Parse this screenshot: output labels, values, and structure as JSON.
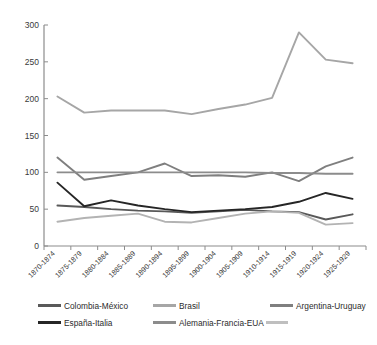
{
  "chart_data": {
    "type": "line",
    "title": "",
    "subtitle": "",
    "xlabel": "",
    "ylabel": "",
    "ylim": [
      0,
      300
    ],
    "yticks": [
      0,
      50,
      100,
      150,
      200,
      250,
      300
    ],
    "grid": false,
    "legend_position": "bottom",
    "categories": [
      "1870-1874",
      "1875-1879",
      "1880-1884",
      "1885-1889",
      "1890-1894",
      "1895-1899",
      "1900-1904",
      "1905-1909",
      "1910-1914",
      "1915-1919",
      "1920-1924",
      "1925-1929"
    ],
    "series": [
      {
        "name": "Colombia-México",
        "color": "#595959",
        "values": [
          55,
          53,
          50,
          48,
          47,
          45,
          47,
          49,
          47,
          46,
          36,
          43
        ]
      },
      {
        "name": "Brasil",
        "color": "#a6a6a6",
        "values": [
          203,
          181,
          184,
          184,
          184,
          179,
          186,
          192,
          201,
          290,
          253,
          248
        ]
      },
      {
        "name": "Argentina-Uruguay",
        "color": "#7f7f7f",
        "values": [
          120,
          90,
          95,
          100,
          112,
          95,
          96,
          94,
          100,
          88,
          108,
          120
        ]
      },
      {
        "name": "España-Italia",
        "color": "#262626",
        "values": [
          86,
          54,
          62,
          55,
          50,
          46,
          48,
          50,
          53,
          60,
          72,
          64
        ]
      },
      {
        "name": "Alemania-Francia-EUA",
        "color": "#8c8c8c",
        "values": [
          100,
          100,
          100,
          100,
          100,
          100,
          100,
          100,
          99,
          99,
          98,
          98
        ]
      },
      {
        "name": "Brasil (low trace)",
        "color": "#b3b3b3",
        "values": [
          33,
          38,
          41,
          44,
          33,
          32,
          38,
          44,
          47,
          45,
          29,
          31
        ]
      }
    ]
  },
  "legend": {
    "items": [
      {
        "label": "Colombia-México",
        "color": "#595959"
      },
      {
        "label": "Brasil",
        "color": "#a6a6a6"
      },
      {
        "label": "Argentina-Uruguay",
        "color": "#7f7f7f"
      },
      {
        "label": "España-Italia",
        "color": "#262626"
      },
      {
        "label": "Alemania-Francia-EUA",
        "color": "#8c8c8c"
      }
    ],
    "trailer_color": "#bfbfbf"
  },
  "axes": {
    "y_tick_labels": [
      "300",
      "250",
      "200",
      "150",
      "100",
      "50",
      "0"
    ],
    "x_tick_labels": [
      "1870-1874",
      "1875-1879",
      "1880-1884",
      "1885-1889",
      "1890-1894",
      "1895-1899",
      "1900-1904",
      "1905-1909",
      "1910-1914",
      "1915-1919",
      "1920-1924",
      "1925-1929"
    ],
    "axis_color": "#8c8c8c"
  }
}
